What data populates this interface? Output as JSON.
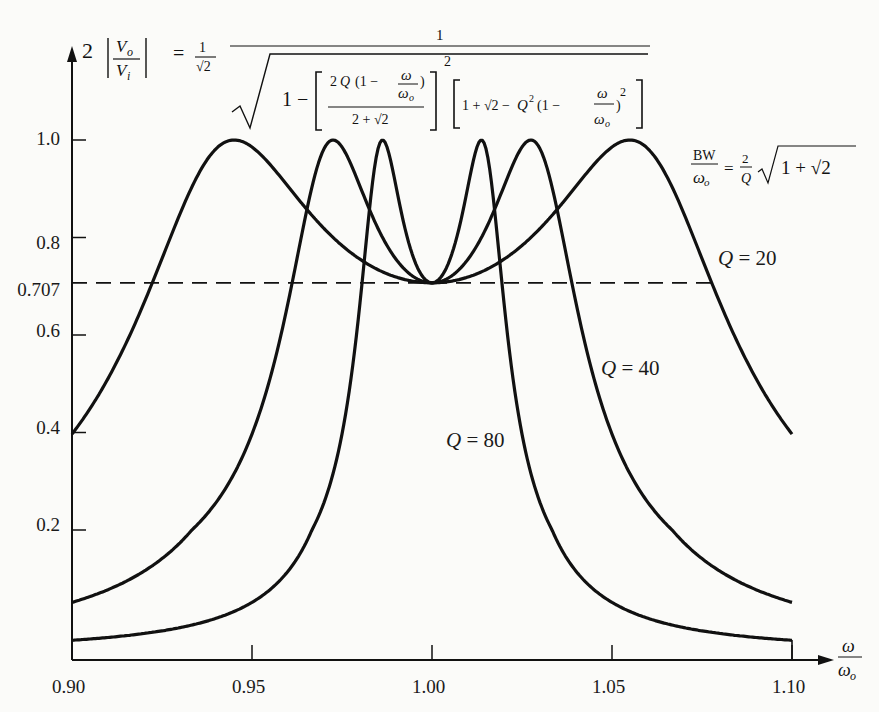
{
  "chart_data": {
    "type": "line",
    "title": "",
    "ylabel": "2 |Vo/Vi|",
    "xlabel": "ω/ωo",
    "xlim": [
      0.9,
      1.1
    ],
    "ylim": [
      0.0,
      1.0
    ],
    "x_ticks": [
      "0.90",
      "0.95",
      "1.00",
      "1.05",
      "1.10"
    ],
    "y_ticks": [
      "0.2",
      "0.4",
      "0.6",
      "0.707",
      "0.8",
      "1.0"
    ],
    "grid": false,
    "reference_line": {
      "y": 0.707,
      "style": "dashed",
      "label": "0.707"
    },
    "equation": "2|Vo/Vi| = (1/√2) · 1/√(1 − [2Q(1 − ω/ωo)/(2+√2)]² [1+√2 − Q²(1 − ω/ωo)²])",
    "bandwidth_annotation": "BW/ωo = (2/Q)√(1+√2)",
    "series": [
      {
        "name": "Q = 20",
        "Q": 20,
        "peak_x": [
          0.945,
          1.055
        ],
        "peak_y": 1.0,
        "endpoint_y": 0.4
      },
      {
        "name": "Q = 40",
        "Q": 40,
        "peak_x": [
          0.973,
          1.027
        ],
        "peak_y": 1.0,
        "endpoint_y": 0.1
      },
      {
        "name": "Q = 80",
        "Q": 80,
        "peak_x": [
          0.986,
          1.014
        ],
        "peak_y": 1.0,
        "endpoint_y": 0.03
      }
    ]
  },
  "labels": {
    "y_axis_prefix": "2",
    "eq_equals": "=",
    "q20": "Q = 20",
    "q40": "Q = 40",
    "q80": "Q = 80"
  }
}
